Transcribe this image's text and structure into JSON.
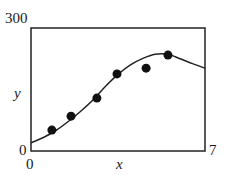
{
  "chart_data": {
    "type": "scatter",
    "title": "",
    "xlabel": "x",
    "ylabel": "y",
    "xlim": [
      0,
      7
    ],
    "ylim": [
      0,
      300
    ],
    "grid": false,
    "legend": null,
    "tick_labels": {
      "y_top": "300",
      "y_bottom": "0",
      "x_left": "0",
      "x_right": "7"
    },
    "series": [
      {
        "name": "data points",
        "type": "scatter",
        "x": [
          0.84,
          1.61,
          2.65,
          3.46,
          4.63,
          5.51
        ],
        "y": [
          51,
          85,
          129,
          188,
          202,
          234
        ]
      },
      {
        "name": "fitted curve",
        "type": "line",
        "x": [
          0,
          0.5,
          1,
          1.5,
          2,
          2.5,
          3,
          3.5,
          4,
          4.5,
          5,
          5.5,
          6,
          6.5,
          7
        ],
        "y": [
          20,
          33,
          50,
          72,
          97,
          125,
          158,
          187,
          210,
          226,
          236,
          236,
          225,
          213,
          202
        ]
      }
    ]
  }
}
